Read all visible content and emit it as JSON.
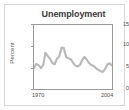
{
  "chart_data": {
    "type": "line",
    "title": "Unemployment",
    "xlabel": "",
    "ylabel": "Percent",
    "xlim": [
      1970,
      2004
    ],
    "ylim": [
      0,
      15
    ],
    "yticks": [
      0,
      5,
      10,
      15
    ],
    "ytick_labels": [
      "0",
      "5",
      "10",
      "15"
    ],
    "xticks": [
      1970,
      2004
    ],
    "xtick_labels": [
      "1970",
      "2004"
    ],
    "grid": false,
    "legend": false,
    "line_color": "#b9b9b9",
    "frame_color": "#9a9a9a",
    "series": [
      {
        "name": "Unemployment rate",
        "x": [
          1970,
          1971,
          1972,
          1973,
          1974,
          1975,
          1976,
          1977,
          1978,
          1979,
          1980,
          1981,
          1982,
          1983,
          1984,
          1985,
          1986,
          1987,
          1988,
          1989,
          1990,
          1991,
          1992,
          1993,
          1994,
          1995,
          1996,
          1997,
          1998,
          1999,
          2000,
          2001,
          2002,
          2003,
          2004
        ],
        "values": [
          4.9,
          5.9,
          5.6,
          4.9,
          5.6,
          8.5,
          7.7,
          7.1,
          6.1,
          5.8,
          7.1,
          7.6,
          9.7,
          9.6,
          7.5,
          7.2,
          7.0,
          6.2,
          5.5,
          5.3,
          5.6,
          6.8,
          7.5,
          6.9,
          6.1,
          5.6,
          5.4,
          4.9,
          4.5,
          4.2,
          4.0,
          4.7,
          5.8,
          6.0,
          5.5
        ]
      }
    ]
  },
  "chart": {
    "title": "Unemployment",
    "ylabel": "Percent",
    "ytick_0": "0",
    "ytick_1": "5",
    "ytick_2": "10",
    "ytick_3": "15",
    "xtick_start": "1970",
    "xtick_end": "2004"
  }
}
